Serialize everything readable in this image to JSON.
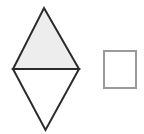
{
  "canvas": {
    "width": 144,
    "height": 134,
    "background": "#ffffff"
  },
  "figure": {
    "shapes": [
      {
        "id": "rhombus",
        "name": "rhombus",
        "description": "Rhombus split by a horizontal diagonal into an upper shaded triangle and a lower unshaded triangle",
        "vertices": {
          "top": [
            44,
            8
          ],
          "left": [
            13,
            69
          ],
          "right": [
            79,
            69
          ],
          "bottom": [
            45.5,
            130
          ]
        },
        "stroke": "#2b2b2b",
        "stroke_width": 2,
        "parts": [
          {
            "id": "upper-triangle",
            "name": "upper-triangle",
            "points": "44,8 79,69 13,69",
            "fill": "#ededed",
            "shaded": true
          },
          {
            "id": "lower-triangle",
            "name": "lower-triangle",
            "points": "13,69 79,69 45.5,130",
            "fill": "#ffffff",
            "shaded": false
          }
        ],
        "diagonal": {
          "id": "horizontal-diagonal",
          "name": "horizontal-diagonal",
          "from": [
            13,
            69
          ],
          "to": [
            79,
            69
          ],
          "stroke": "#2b2b2b",
          "stroke_width": 2
        }
      },
      {
        "id": "square",
        "name": "square",
        "description": "Outlined square with white fill",
        "x": 104,
        "y": 51,
        "width": 32,
        "height": 37,
        "fill": "#ffffff",
        "stroke": "#9a9a9a",
        "stroke_width": 2
      }
    ]
  },
  "colors": {
    "shade_fill": "#ededed",
    "dark_outline": "#2b2b2b",
    "gray_outline": "#9a9a9a",
    "white": "#ffffff"
  }
}
